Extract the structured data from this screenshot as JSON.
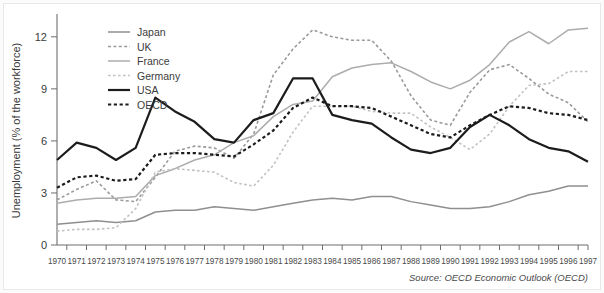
{
  "chart_data": {
    "type": "line",
    "title": "",
    "xlabel": "",
    "ylabel": "Unemployment (% of the workforce)",
    "ylim": [
      0,
      13.2
    ],
    "yticks": [
      0,
      3,
      6,
      9,
      12
    ],
    "grid": false,
    "legend_position": "top-left inside plot",
    "source_note": "Source: OECD Economic Outlook (OECD)",
    "categories": [
      "1970",
      "1971",
      "1972",
      "1973",
      "1974",
      "1975",
      "1976",
      "1977",
      "1978",
      "1979",
      "1980",
      "1981",
      "1982",
      "1983",
      "1984",
      "1985",
      "1986",
      "1987",
      "1988",
      "1989",
      "1990",
      "1991",
      "1992",
      "1993",
      "1994",
      "1995",
      "1996",
      "1997"
    ],
    "series": [
      {
        "name": "Japan",
        "color": "#8f8f8f",
        "dash": "none",
        "width": 1.5,
        "values": [
          1.2,
          1.3,
          1.4,
          1.3,
          1.4,
          1.9,
          2.0,
          2.0,
          2.2,
          2.1,
          2.0,
          2.2,
          2.4,
          2.6,
          2.7,
          2.6,
          2.8,
          2.8,
          2.5,
          2.3,
          2.1,
          2.1,
          2.2,
          2.5,
          2.9,
          3.1,
          3.4,
          3.4
        ]
      },
      {
        "name": "UK",
        "color": "#9a9a9a",
        "dash": "3,2.4",
        "width": 1.6,
        "values": [
          2.6,
          3.2,
          3.7,
          2.6,
          2.5,
          3.9,
          5.4,
          5.7,
          5.6,
          5.0,
          6.4,
          9.8,
          11.3,
          12.4,
          12.0,
          11.8,
          11.8,
          10.6,
          8.6,
          7.2,
          6.9,
          8.8,
          10.1,
          10.4,
          9.6,
          8.7,
          8.2,
          7.1
        ]
      },
      {
        "name": "France",
        "color": "#acacac",
        "dash": "none",
        "width": 1.5,
        "values": [
          2.4,
          2.6,
          2.7,
          2.7,
          2.8,
          4.0,
          4.4,
          4.9,
          5.2,
          5.9,
          6.3,
          7.4,
          8.1,
          8.3,
          9.7,
          10.2,
          10.4,
          10.5,
          10.0,
          9.4,
          9.0,
          9.5,
          10.4,
          11.7,
          12.3,
          11.6,
          12.4,
          12.5
        ]
      },
      {
        "name": "Germany",
        "color": "#c2c2c2",
        "dash": "2.6,2.4",
        "width": 1.6,
        "values": [
          0.8,
          0.9,
          0.9,
          1.0,
          2.1,
          4.2,
          4.4,
          4.3,
          4.2,
          3.6,
          3.4,
          4.6,
          6.5,
          8.0,
          8.0,
          8.0,
          7.7,
          7.6,
          7.6,
          6.8,
          6.2,
          5.5,
          6.4,
          8.0,
          9.2,
          9.3,
          10.0,
          10.0
        ]
      },
      {
        "name": "USA",
        "color": "#1c1c1c",
        "dash": "none",
        "width": 2.2,
        "values": [
          4.9,
          5.9,
          5.6,
          4.9,
          5.6,
          8.5,
          7.7,
          7.1,
          6.1,
          5.9,
          7.2,
          7.6,
          9.6,
          9.6,
          7.5,
          7.2,
          7.0,
          6.2,
          5.5,
          5.3,
          5.6,
          6.8,
          7.5,
          6.9,
          6.1,
          5.6,
          5.4,
          4.8
        ]
      },
      {
        "name": "OECD",
        "color": "#1c1c1c",
        "dash": "3.2,2.6",
        "width": 2.2,
        "values": [
          3.3,
          3.9,
          4.0,
          3.7,
          3.8,
          5.2,
          5.3,
          5.3,
          5.2,
          5.1,
          5.8,
          6.6,
          7.9,
          8.5,
          8.0,
          8.0,
          7.9,
          7.4,
          6.9,
          6.4,
          6.2,
          6.9,
          7.5,
          8.0,
          7.9,
          7.6,
          7.5,
          7.2
        ]
      }
    ]
  },
  "legend": {
    "items": [
      {
        "label": "Japan"
      },
      {
        "label": "UK"
      },
      {
        "label": "France"
      },
      {
        "label": "Germany"
      },
      {
        "label": "USA"
      },
      {
        "label": "OECD"
      }
    ]
  }
}
